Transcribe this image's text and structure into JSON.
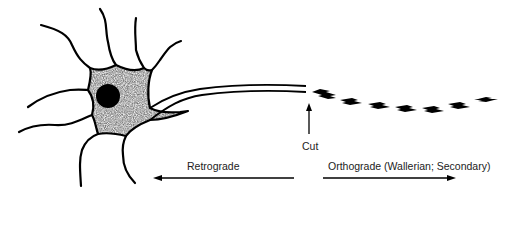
{
  "diagram": {
    "labels": {
      "cut": "Cut",
      "retrograde": "Retrograde",
      "orthograde": "Orthograde (Wallerian; Secondary)"
    },
    "colors": {
      "stroke": "#000000",
      "soma_fill": "#d8d8d8",
      "nucleus": "#000000",
      "background": "#ffffff"
    }
  }
}
